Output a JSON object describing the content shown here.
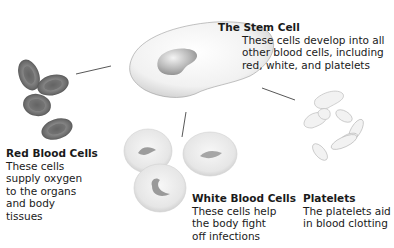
{
  "diagram": {
    "nodes": [
      {
        "id": "stem",
        "title": "The Stem Cell",
        "desc_lines": [
          "These cells develop into all",
          "other blood cells, including",
          "red, white, and platelets"
        ]
      },
      {
        "id": "rbc",
        "title": "Red Blood Cells",
        "desc_lines": [
          "These cells",
          "supply oxygen",
          "to the organs",
          "and body",
          "tissues"
        ]
      },
      {
        "id": "wbc",
        "title": "White Blood Cells",
        "desc_lines": [
          "These cells help",
          "the body fight",
          "off infections"
        ]
      },
      {
        "id": "plt",
        "title": "Platelets",
        "desc_lines": [
          "The platelets aid",
          "in blood clotting"
        ]
      }
    ],
    "edges": [
      {
        "from": "stem",
        "to": "rbc"
      },
      {
        "from": "stem",
        "to": "wbc"
      },
      {
        "from": "stem",
        "to": "plt"
      }
    ]
  }
}
